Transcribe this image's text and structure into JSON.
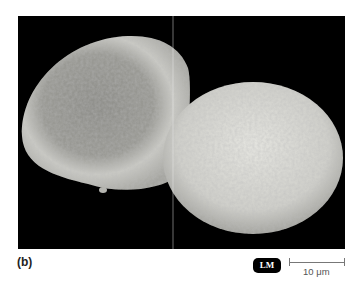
{
  "figure": {
    "panel_label": "(b)",
    "badge": "LM",
    "scale_bar": {
      "label": "10 μm"
    },
    "colors": {
      "background": "#000000",
      "cell_light": "#d9d9d4",
      "cell_dark": "#8c8c88"
    }
  }
}
